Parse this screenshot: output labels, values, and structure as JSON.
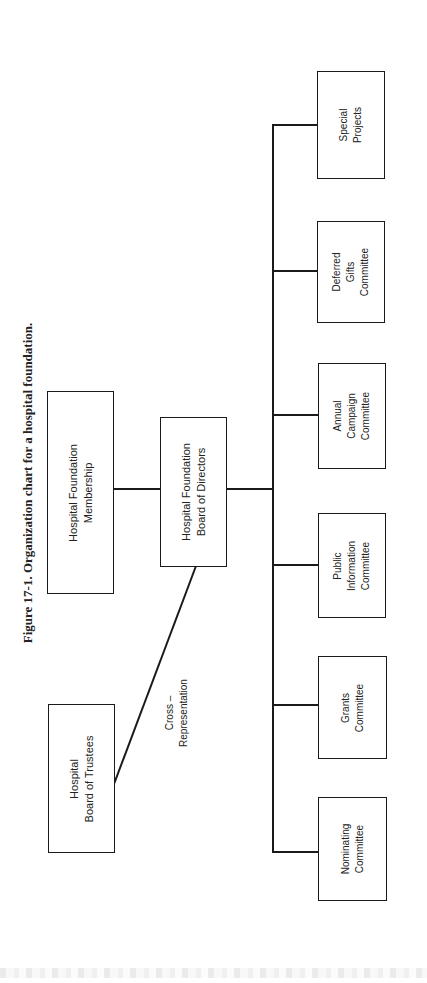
{
  "figure": {
    "caption": "Figure 17-1.  Organization chart for a hospital foundation."
  },
  "nodes": {
    "membership": "Hospital Foundation\nMembership",
    "board_of_directors": "Hospital Foundation\nBoard of Directors",
    "board_of_trustees": "Hospital\nBoard of Trustees",
    "committees": [
      "Special\nProjects",
      "Deferred\nGifts\nCommittee",
      "Annual\nCampaign\nCommittee",
      "Public\nInformation\nCommittee",
      "Grants\nCommittee",
      "Nominating\nCommittee"
    ]
  },
  "edges": {
    "cross_label": "Cross –\nRepresentation"
  },
  "colors": {
    "line": "#1a1a1a",
    "background": "#ffffff"
  }
}
